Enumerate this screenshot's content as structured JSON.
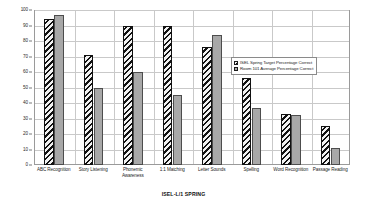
{
  "chart_data": {
    "type": "bar",
    "title": "",
    "xlabel": "ISEL-L/1 SPRING",
    "ylabel": "",
    "ylim": [
      0,
      100
    ],
    "ytick_step": 10,
    "yticks": [
      0,
      10,
      20,
      30,
      40,
      50,
      60,
      70,
      80,
      90,
      100
    ],
    "ytick_labels": [
      "0",
      "10",
      "20",
      "30",
      "40",
      "50",
      "60",
      "70",
      "80",
      "90",
      "100"
    ],
    "grid": true,
    "legend_position": "inside-right",
    "categories": [
      "ABC Recognition",
      "Story Listening",
      "Phonemic Awareness",
      "1:1 Matching",
      "Letter Sounds",
      "Spelling",
      "Word Recognition",
      "Passage Reading"
    ],
    "series": [
      {
        "name": "ISEL Spring Target Percentage Correct",
        "color": "#111111",
        "fill": "diagonal-hatch",
        "values": [
          94,
          71,
          90,
          90,
          76,
          56,
          33,
          25
        ]
      },
      {
        "name": "Room 101 Average Percentage Correct",
        "color": "#a8a8a8",
        "fill": "solid",
        "values": [
          97,
          50,
          60,
          45,
          84,
          37,
          32,
          11
        ]
      }
    ]
  },
  "legend": {
    "items": [
      {
        "label": "ISEL Spring Target Percentage Correct"
      },
      {
        "label": "Room 101 Average Percentage Correct"
      }
    ]
  },
  "axis": {
    "x_title": "ISEL-L/1 SPRING"
  }
}
